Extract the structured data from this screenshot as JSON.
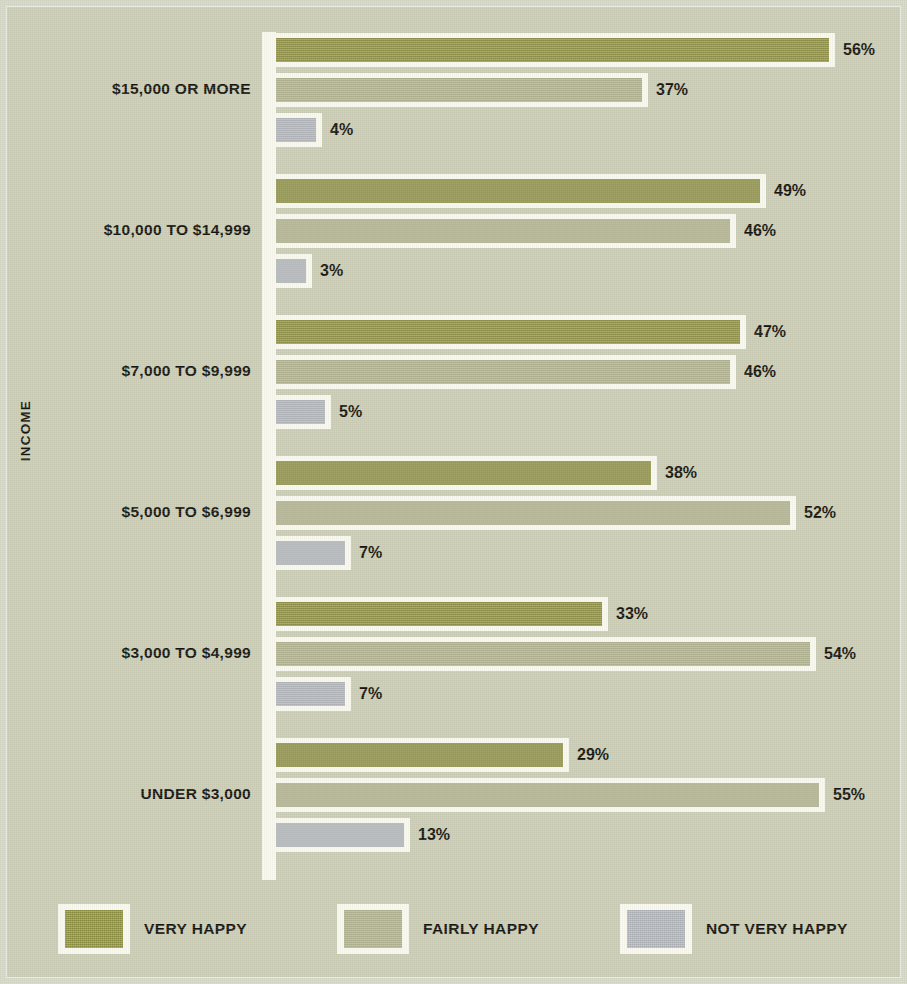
{
  "chart_data": {
    "type": "bar",
    "orientation": "horizontal",
    "title": "",
    "xlabel": "",
    "ylabel": "INCOME",
    "grid": false,
    "legend_position": "bottom",
    "value_suffix": "%",
    "xlim": [
      0,
      60
    ],
    "categories": [
      "$15,000 OR MORE",
      "$10,000 TO $14,999",
      "$7,000 TO $9,999",
      "$5,000 TO $6,999",
      "$3,000 TO $4,999",
      "UNDER $3,000"
    ],
    "series": [
      {
        "name": "VERY HAPPY",
        "color": "#8b8d3f",
        "values": [
          56,
          49,
          47,
          38,
          33,
          29
        ],
        "labels": [
          "56%",
          "49%",
          "47%",
          "38%",
          "33%",
          "29%"
        ]
      },
      {
        "name": "FAIRLY HAPPY",
        "color": "#adae89",
        "values": [
          37,
          46,
          46,
          52,
          54,
          55
        ],
        "labels": [
          "37%",
          "46%",
          "46%",
          "52%",
          "54%",
          "55%"
        ]
      },
      {
        "name": "NOT VERY HAPPY",
        "color": "#aeb1b6",
        "values": [
          4,
          3,
          5,
          7,
          7,
          13
        ],
        "labels": [
          "4%",
          "3%",
          "5%",
          "7%",
          "7%",
          "13%"
        ]
      }
    ]
  },
  "axis": {
    "ylabel": "INCOME"
  },
  "legend": {
    "items": [
      {
        "label": "VERY HAPPY",
        "color": "#8b8d3f",
        "swatch": "very-happy-swatch"
      },
      {
        "label": "FAIRLY HAPPY",
        "color": "#adae89",
        "swatch": "fairly-happy-swatch"
      },
      {
        "label": "NOT VERY HAPPY",
        "color": "#aeb1b6",
        "swatch": "not-very-happy-swatch"
      }
    ]
  },
  "colors": {
    "background": "#cbcdb6",
    "frame": "#d6d8c6",
    "bar_outline": "#faf9ef",
    "text": "#15130e",
    "very_happy": "#8b8d3f",
    "fairly_happy": "#adae89",
    "not_very_happy": "#aeb1b6"
  }
}
